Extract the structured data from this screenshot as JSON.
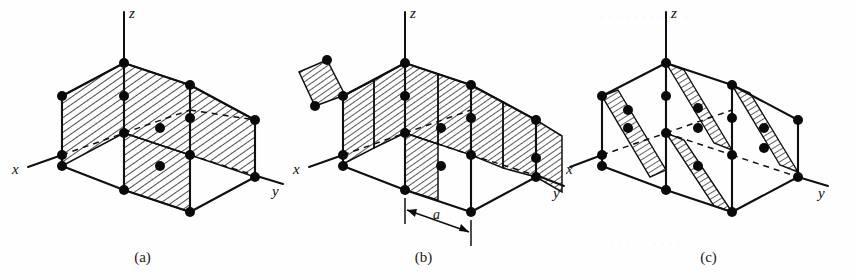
{
  "figure": {
    "kind": "crystal-lattice-planes",
    "background_color": "#fefefe",
    "ink_color": "#101010",
    "panel_count": 3
  },
  "panels": [
    {
      "id": "a",
      "caption": "(a)",
      "axes": {
        "x": "x",
        "y": "y",
        "z": "z"
      },
      "plane_count": 3,
      "dimension_label": null
    },
    {
      "id": "b",
      "caption": "(b)",
      "axes": {
        "x": "x",
        "y": "y",
        "z": "z"
      },
      "plane_count": 6,
      "dimension_label": "a"
    },
    {
      "id": "c",
      "caption": "(c)",
      "axes": {
        "x": "x",
        "y": "y",
        "z": "z"
      },
      "plane_count": 3,
      "dimension_label": null
    }
  ],
  "labels": {
    "axis_x": "x",
    "axis_y": "y",
    "axis_z": "z",
    "spacing": "a",
    "caption_a": "(a)",
    "caption_b": "(b)",
    "caption_c": "(c)"
  }
}
